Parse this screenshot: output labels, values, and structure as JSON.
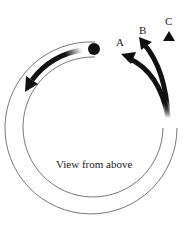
{
  "diagram": {
    "caption": "View from above",
    "labels": {
      "a": "A",
      "b": "B",
      "c": "C"
    },
    "colors": {
      "stroke": "#555555",
      "arrow": "#111111"
    },
    "elements": [
      "circular-track",
      "ball",
      "motion-arrow",
      "exit-path-a",
      "exit-path-b",
      "exit-path-c"
    ]
  }
}
